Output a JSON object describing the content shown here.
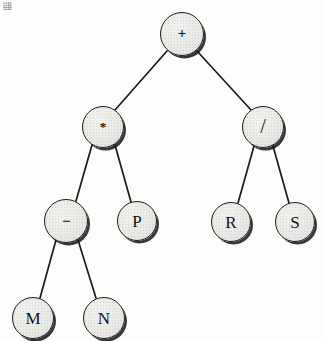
{
  "figure": {
    "kind": "binary-expression-tree",
    "background_color": "#fdfdfc",
    "node_fill_color": "#e9e9e6",
    "node_stroke_color": "#1b1b1b",
    "edge_color": "#1d1a19",
    "label_color": "#16120f",
    "width": 324,
    "height": 341
  },
  "nodes": [
    {
      "id": "n0",
      "label": "+",
      "kind": "operator",
      "style": "op-plus",
      "cx": 182,
      "cy": 34,
      "r": 22
    },
    {
      "id": "n1",
      "label": "*",
      "kind": "operator",
      "style": "op-times",
      "cx": 103,
      "cy": 127,
      "r": 21
    },
    {
      "id": "n2",
      "label": "/",
      "kind": "operator",
      "style": "op-div",
      "cx": 263,
      "cy": 127,
      "r": 21
    },
    {
      "id": "n3",
      "label": "−",
      "kind": "operator",
      "style": "op-minus",
      "cx": 66,
      "cy": 221,
      "r": 22
    },
    {
      "id": "n4",
      "label": "P",
      "kind": "operand",
      "style": "letter",
      "cx": 137,
      "cy": 221,
      "r": 20
    },
    {
      "id": "n5",
      "label": "R",
      "kind": "operand",
      "style": "letter",
      "cx": 231,
      "cy": 222,
      "r": 20
    },
    {
      "id": "n6",
      "label": "S",
      "kind": "operand",
      "style": "letter",
      "cx": 295,
      "cy": 222,
      "r": 20
    },
    {
      "id": "n7",
      "label": "M",
      "kind": "operand",
      "style": "letter",
      "cx": 33,
      "cy": 318,
      "r": 21
    },
    {
      "id": "n8",
      "label": "N",
      "kind": "operand",
      "style": "letter",
      "cx": 104,
      "cy": 318,
      "r": 21
    }
  ],
  "edges": [
    {
      "from": "n0",
      "to": "n1",
      "x1": 167,
      "y1": 51,
      "x2": 115,
      "y2": 110
    },
    {
      "from": "n0",
      "to": "n2",
      "x1": 197,
      "y1": 51,
      "x2": 251,
      "y2": 110
    },
    {
      "from": "n1",
      "to": "n3",
      "x1": 92,
      "y1": 145,
      "x2": 76,
      "y2": 201
    },
    {
      "from": "n1",
      "to": "n4",
      "x1": 115,
      "y1": 145,
      "x2": 131,
      "y2": 202
    },
    {
      "from": "n2",
      "to": "n5",
      "x1": 254,
      "y1": 146,
      "x2": 238,
      "y2": 203
    },
    {
      "from": "n2",
      "to": "n6",
      "x1": 273,
      "y1": 146,
      "x2": 289,
      "y2": 203
    },
    {
      "from": "n3",
      "to": "n7",
      "x1": 56,
      "y1": 240,
      "x2": 40,
      "y2": 298
    },
    {
      "from": "n3",
      "to": "n8",
      "x1": 78,
      "y1": 240,
      "x2": 96,
      "y2": 298
    }
  ]
}
